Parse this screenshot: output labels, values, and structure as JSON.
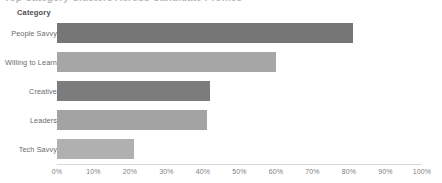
{
  "title": {
    "text": "Top Category Clusters Across Candidate Profiles",
    "clipped": true
  },
  "axis_heading": "Category",
  "chart_data": {
    "type": "bar",
    "orientation": "horizontal",
    "title": "Top Category Clusters Across Candidate Profiles",
    "xlabel": "",
    "ylabel": "Category",
    "categories": [
      "People Savvy",
      "Willing to Learn",
      "Creative",
      "Leaders",
      "Tech Savvy"
    ],
    "values": [
      81,
      60,
      42,
      41,
      21
    ],
    "value_suffix": "%",
    "xlim": [
      0,
      100
    ],
    "tick_labels": [
      "0%",
      "10%",
      "20%",
      "30%",
      "40%",
      "50%",
      "60%",
      "70%",
      "80%",
      "90%",
      "100%"
    ],
    "tick_values": [
      0,
      10,
      20,
      30,
      40,
      50,
      60,
      70,
      80,
      90,
      100
    ],
    "grid": false,
    "legend": false,
    "bar_colors": [
      "#767676",
      "#a6a6a6",
      "#7c7c7c",
      "#a3a3a3",
      "#b0b0b0"
    ]
  },
  "colors": {
    "axis_line": "#d9d9d9",
    "tick_text": "#808080",
    "label_text": "#6b6b6b",
    "heading_text": "#4d4d4d",
    "background": "#ffffff"
  }
}
